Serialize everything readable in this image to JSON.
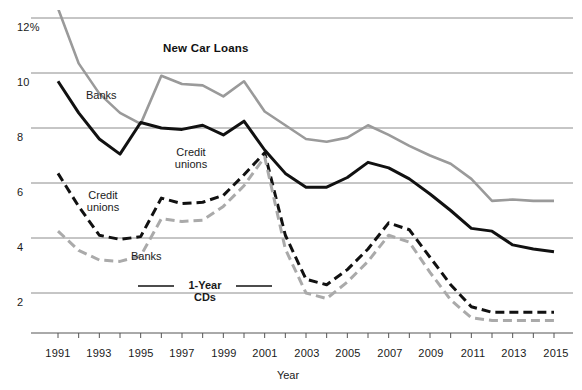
{
  "chart_data": {
    "type": "line",
    "title": "New Car Loans",
    "xlabel": "Year",
    "ylabel": "",
    "grid": true,
    "legend_position": "inline-annotations",
    "xlim": [
      1991,
      2015
    ],
    "ylim": [
      0.8,
      12.4
    ],
    "yticks": [
      12,
      10,
      8,
      6,
      4,
      2
    ],
    "ytick_labels": [
      "12%",
      "10",
      "8",
      "6",
      "4",
      "2"
    ],
    "x": [
      1991,
      1992,
      1993,
      1994,
      1995,
      1996,
      1997,
      1998,
      1999,
      2000,
      2001,
      2002,
      2003,
      2004,
      2005,
      2006,
      2007,
      2008,
      2009,
      2010,
      2011,
      2012,
      2013,
      2014,
      2015
    ],
    "xticks": [
      1991,
      1992,
      1993,
      1994,
      1995,
      1996,
      1997,
      1998,
      1999,
      2000,
      2001,
      2002,
      2003,
      2004,
      2005,
      2006,
      2007,
      2008,
      2009,
      2010,
      2011,
      2012,
      2013,
      2014,
      2015
    ],
    "xtick_labels": [
      "1991",
      "",
      "1993",
      "",
      "1995",
      "",
      "1997",
      "",
      "1999",
      "",
      "2001",
      "",
      "2003",
      "",
      "2005",
      "",
      "2007",
      "",
      "2009",
      "",
      "2011",
      "",
      "2013",
      "",
      "2015"
    ],
    "series": [
      {
        "name": "Banks — New Car Loans",
        "style": "solid",
        "color": "#9a9a9a",
        "width": 2.6,
        "values": [
          12.35,
          10.35,
          9.25,
          8.55,
          8.15,
          9.9,
          9.6,
          9.55,
          9.15,
          9.7,
          8.6,
          8.1,
          7.6,
          7.5,
          7.65,
          8.1,
          7.75,
          7.35,
          7.0,
          6.7,
          6.15,
          5.35,
          5.4,
          5.35,
          5.35
        ],
        "label_text": "Banks",
        "label_x": 0.155,
        "label_y": 0.235
      },
      {
        "name": "Credit unions — New Car Loans",
        "style": "solid",
        "color": "#111111",
        "width": 3.0,
        "values": [
          9.7,
          8.55,
          7.6,
          7.05,
          8.2,
          8.0,
          7.95,
          8.1,
          7.75,
          8.25,
          7.2,
          6.35,
          5.85,
          5.85,
          6.2,
          6.75,
          6.55,
          6.15,
          5.6,
          5.0,
          4.35,
          4.25,
          3.75,
          3.6,
          3.5
        ],
        "label_text": "Credit\nunions",
        "label_x": 0.33,
        "label_y": 0.385
      },
      {
        "name": "Credit unions — 1-Year CDs",
        "style": "dashed",
        "color": "#111111",
        "width": 3.0,
        "values": [
          6.35,
          5.15,
          4.1,
          3.95,
          4.05,
          5.45,
          5.25,
          5.3,
          5.55,
          6.3,
          7.1,
          4.1,
          2.5,
          2.3,
          2.85,
          3.6,
          4.55,
          4.3,
          3.3,
          2.3,
          1.5,
          1.3,
          1.3,
          1.3,
          1.3
        ],
        "label_text": "Credit\nunions",
        "label_x": 0.155,
        "label_y": 0.52
      },
      {
        "name": "Banks — 1-Year CDs",
        "style": "dashed",
        "color": "#aaaaaa",
        "width": 3.0,
        "values": [
          4.25,
          3.55,
          3.2,
          3.15,
          3.35,
          4.7,
          4.6,
          4.65,
          5.15,
          5.9,
          6.95,
          3.6,
          2.0,
          1.8,
          2.4,
          3.15,
          4.1,
          3.85,
          2.75,
          1.75,
          1.1,
          1.0,
          1.0,
          1.0,
          1.0
        ],
        "label_text": "Banks",
        "label_x": 0.255,
        "label_y": 0.655
      }
    ],
    "annotations": [
      {
        "text": "New Car Loans",
        "kind": "title"
      },
      {
        "text": "1-Year",
        "kind": "group-label-line1"
      },
      {
        "text": "CDs",
        "kind": "group-label-line2"
      },
      {
        "text": "Year",
        "kind": "axis-title"
      }
    ]
  },
  "axis": {
    "y_tick_0": "12%",
    "y_tick_1": "10",
    "y_tick_2": "8",
    "y_tick_3": "6",
    "y_tick_4": "4",
    "y_tick_5": "2",
    "x_tick_1991": "1991",
    "x_tick_1993": "1993",
    "x_tick_1995": "1995",
    "x_tick_1997": "1997",
    "x_tick_1999": "1999",
    "x_tick_2001": "2001",
    "x_tick_2003": "2003",
    "x_tick_2005": "2005",
    "x_tick_2007": "2007",
    "x_tick_2009": "2009",
    "x_tick_2011": "2011",
    "x_tick_2013": "2013",
    "x_tick_2015": "2015",
    "x_axis_title": "Year"
  },
  "labels": {
    "title": "New Car Loans",
    "banks_loans": "Banks",
    "credit_unions_loans_line1": "Credit",
    "credit_unions_loans_line2": "unions",
    "credit_unions_cds_line1": "Credit",
    "credit_unions_cds_line2": "unions",
    "banks_cds": "Banks",
    "cds_group_line1": "1-Year",
    "cds_group_line2": "CDs"
  },
  "colors": {
    "series_dark": "#111111",
    "series_gray": "#9a9a9a",
    "series_gray_dashed": "#aaaaaa",
    "gridline": "#8c8c8c",
    "background": "#ffffff"
  }
}
